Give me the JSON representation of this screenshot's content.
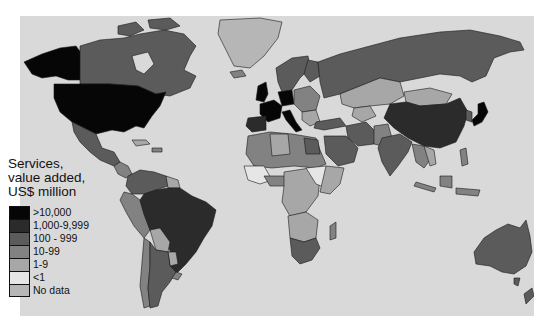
{
  "map": {
    "type": "choropleth world map",
    "sea_color": "#d9d9d9"
  },
  "legend": {
    "title_lines": [
      "Services,",
      "value added,",
      "US$ million"
    ],
    "items": [
      {
        "label": ">10,000",
        "color": "#060606"
      },
      {
        "label": "1,000-9,999",
        "color": "#2b2b2b"
      },
      {
        "label": "100 - 999",
        "color": "#5b5b5b"
      },
      {
        "label": "10-99",
        "color": "#828282"
      },
      {
        "label": "1-9",
        "color": "#a7a7a7"
      },
      {
        "label": "<1",
        "color": "#e6e6e6"
      },
      {
        "label": "No data",
        "color": "#b6b6b6"
      }
    ]
  }
}
